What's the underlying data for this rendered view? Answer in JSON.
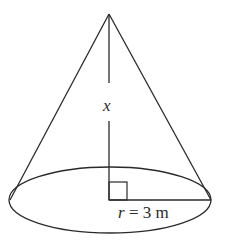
{
  "figure": {
    "type": "right circular cone",
    "labels": {
      "height_var": "x",
      "radius_var": "r",
      "radius_eq": " = 3 m"
    },
    "values": {
      "radius": 3,
      "radius_unit": "m",
      "height": "x"
    },
    "annotations": [
      "right-angle marker at base center"
    ],
    "colors": {
      "stroke": "#2a2a2a",
      "background": "#ffffff"
    }
  }
}
